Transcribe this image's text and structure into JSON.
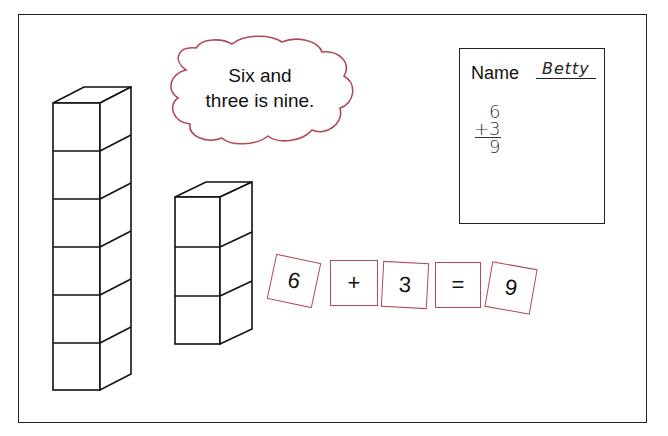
{
  "scene": {
    "title": "Addition with unit cubes",
    "frame_color": "#222222",
    "accent_color": "#b04a5a"
  },
  "speech_bubble": {
    "line1": "Six and",
    "line2": "three is nine.",
    "border_color": "#b04a5a"
  },
  "cube_towers": [
    {
      "name": "tower-six",
      "cube_count": 6
    },
    {
      "name": "tower-three",
      "cube_count": 3
    }
  ],
  "worksheet": {
    "name_label": "Name",
    "name_value": "Betty",
    "addend1": "6",
    "addend2": "+3",
    "sum": "9"
  },
  "equation_cards": [
    {
      "label": "6",
      "rotation": 12
    },
    {
      "label": "+",
      "rotation": 0
    },
    {
      "label": "3",
      "rotation": 3
    },
    {
      "label": "=",
      "rotation": 0
    },
    {
      "label": "9",
      "rotation": 8
    }
  ]
}
